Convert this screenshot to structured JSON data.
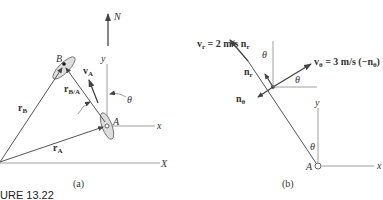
{
  "panel_a": {
    "caption": "(a)",
    "axis_N": "N",
    "axis_X": "X",
    "axis_x": "x",
    "axis_y": "y",
    "point_A": "A",
    "point_B": "B",
    "angle": "θ",
    "vec_rB": "r",
    "vec_rB_sub": "B",
    "vec_rA": "r",
    "vec_rA_sub": "A",
    "vec_rBA": "r",
    "vec_rBA_sub": "B/A",
    "vec_vA": "v",
    "vec_vA_sub": "A"
  },
  "panel_b": {
    "caption": "(b)",
    "vr_label": "v",
    "vr_sub": "r",
    "vr_value": " = 2 m/s n",
    "vr_value_sub": "r",
    "vtheta_label": "v",
    "vtheta_sub": "θ",
    "vtheta_value": " = 3 m/s (−n",
    "vtheta_value_sub": "θ",
    "vtheta_close": ")",
    "nr_label": "n",
    "nr_sub": "r",
    "ntheta_label": "n",
    "ntheta_sub": "θ",
    "angle_top": "θ",
    "angle_mid": "θ",
    "angle_bottom": "θ",
    "axis_x": "x",
    "axis_y": "y",
    "point_A": "A"
  },
  "figure_caption": "URE 13.22"
}
